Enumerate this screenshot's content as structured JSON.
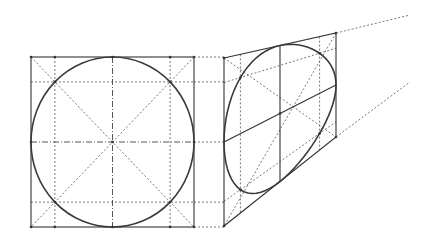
{
  "diagram": {
    "title": "",
    "colors": {
      "line": "#333333",
      "construction": "#555555",
      "background": "#ffffff"
    },
    "components": [
      {
        "id": "front-square",
        "type": "square",
        "subdivision": "center lines, diagonals, quarter-point grid lines"
      },
      {
        "id": "inscribed-circle",
        "type": "circle",
        "inscribed_in": "front-square"
      },
      {
        "id": "oblique-face",
        "type": "parallelogram",
        "subdivision": "center lines, diagonals, transferred grid lines"
      },
      {
        "id": "inscribed-ellipse",
        "type": "ellipse",
        "inscribed_in": "oblique-face"
      },
      {
        "id": "projection-lines",
        "type": "dashed receding lines",
        "count": 2
      },
      {
        "id": "transfer-lines",
        "type": "dashed horizontal lines",
        "from": "front-square",
        "to": "oblique-face"
      }
    ],
    "labels": []
  }
}
